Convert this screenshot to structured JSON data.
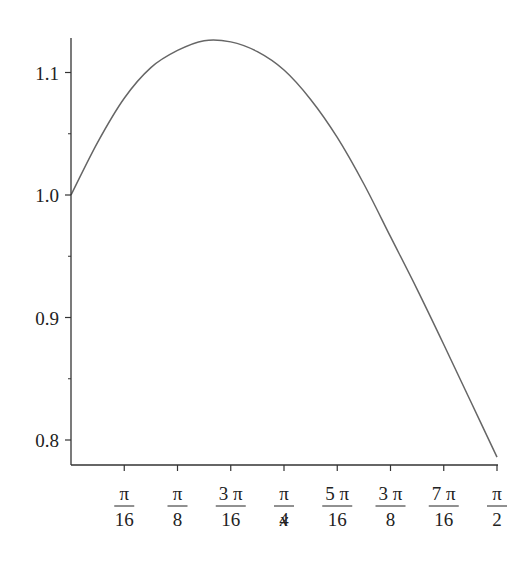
{
  "chart_data": {
    "type": "line",
    "title": "",
    "xlabel": "x",
    "ylabel": "",
    "xlim": [
      0,
      1.5708
    ],
    "ylim": [
      0.78,
      1.13
    ],
    "grid": false,
    "legend": null,
    "x_ticks": [
      {
        "num": "π",
        "den": "16",
        "value": 0.19635
      },
      {
        "num": "π",
        "den": "8",
        "value": 0.3927
      },
      {
        "num": "3 π",
        "den": "16",
        "value": 0.58905
      },
      {
        "num": "π",
        "den": "4",
        "value": 0.7854
      },
      {
        "num": "5 π",
        "den": "16",
        "value": 0.98175
      },
      {
        "num": "3 π",
        "den": "8",
        "value": 1.1781
      },
      {
        "num": "7 π",
        "den": "16",
        "value": 1.37445
      },
      {
        "num": "π",
        "den": "2",
        "value": 1.5708
      }
    ],
    "y_ticks": [
      {
        "label": "0.8",
        "value": 0.8
      },
      {
        "label": "0.9",
        "value": 0.9
      },
      {
        "label": "1.0",
        "value": 1.0
      },
      {
        "label": "1.1",
        "value": 1.1
      }
    ],
    "y_minor_ticks": [
      0.85,
      0.95,
      1.05
    ],
    "series": [
      {
        "name": "f(x)",
        "color": "#666666",
        "x": [
          0,
          0.0982,
          0.19635,
          0.2945,
          0.3927,
          0.4909,
          0.58905,
          0.6872,
          0.7854,
          0.8836,
          0.98175,
          1.0799,
          1.1781,
          1.2763,
          1.37445,
          1.4726,
          1.5708
        ],
        "y": [
          1.0,
          1.043,
          1.079,
          1.104,
          1.118,
          1.126,
          1.125,
          1.117,
          1.102,
          1.078,
          1.047,
          1.009,
          0.966,
          0.923,
          0.878,
          0.832,
          0.786
        ]
      }
    ]
  }
}
